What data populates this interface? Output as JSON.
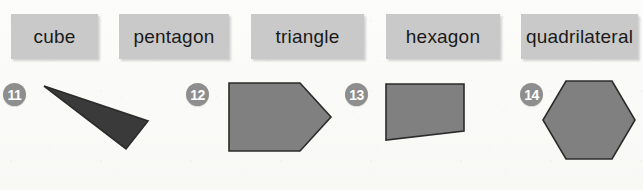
{
  "page": {
    "background_color": "#fbfbf9",
    "width": 643,
    "height": 190
  },
  "colors": {
    "label_box_fill": "#c9c9c9",
    "label_text": "#1a1a1a",
    "badge_fill": "#8e8e8e",
    "badge_text": "#ffffff",
    "shape_fill_gray": "#808080",
    "shape_fill_dark": "#3a3a3a",
    "shape_stroke": "#2b2b2b"
  },
  "labels": [
    {
      "text": "cube",
      "x": 11,
      "y": 14,
      "w": 87,
      "h": 45
    },
    {
      "text": "pentagon",
      "x": 119,
      "y": 14,
      "w": 110,
      "h": 45
    },
    {
      "text": "triangle",
      "x": 251,
      "y": 14,
      "w": 113,
      "h": 45
    },
    {
      "text": "hexagon",
      "x": 386,
      "y": 14,
      "w": 114,
      "h": 45
    },
    {
      "text": "quadrilateral",
      "x": 521,
      "y": 14,
      "w": 117,
      "h": 45
    }
  ],
  "items": [
    {
      "badge": "11",
      "badge_x": 3,
      "badge_y": 83,
      "shape_name": "thin-triangle",
      "shape_kind": "polygon",
      "fill": "#3a3a3a",
      "points": "44,86 148,121 126,149",
      "svg_x": 0,
      "svg_y": 0,
      "svg_w": 200,
      "svg_h": 190
    },
    {
      "badge": "12",
      "badge_x": 186,
      "badge_y": 83,
      "shape_name": "home-plate-pentagon",
      "shape_kind": "polygon",
      "fill": "#808080",
      "points": "229,83 300,83 331,117 300,151 229,151",
      "svg_x": 0,
      "svg_y": 0,
      "svg_w": 400,
      "svg_h": 190
    },
    {
      "badge": "13",
      "badge_x": 345,
      "badge_y": 83,
      "shape_name": "trapezoid-quadrilateral",
      "shape_kind": "polygon",
      "fill": "#808080",
      "points": "386,84 464,84 464,131 386,140",
      "svg_x": 0,
      "svg_y": 0,
      "svg_w": 520,
      "svg_h": 190
    },
    {
      "badge": "14",
      "badge_x": 520,
      "badge_y": 83,
      "shape_name": "regular-hexagon",
      "shape_kind": "polygon",
      "fill": "#808080",
      "points": "566,81 612,81 635,120 612,159 566,159 543,120",
      "svg_x": 0,
      "svg_y": 0,
      "svg_w": 643,
      "svg_h": 190
    }
  ]
}
